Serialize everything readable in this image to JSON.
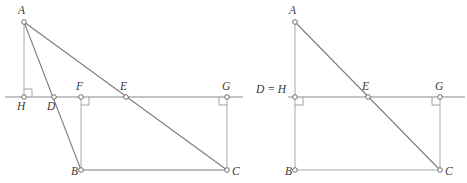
{
  "figure": {
    "title": "",
    "width": 467,
    "height": 183,
    "background": "#ffffff",
    "stroke_color": "#7d7d7d",
    "axis_color": "#8a8a8a",
    "vertex_fill": "#ffffff",
    "vertex_stroke": "#5d5d5d",
    "label_color": "#3a3a3a"
  },
  "panels": [
    {
      "id": "left",
      "name": "left-diagram",
      "points": {
        "A": {
          "label": "A",
          "x": 24,
          "y": 22,
          "lx": 18,
          "ly": 14
        },
        "B": {
          "label": "B",
          "x": 81,
          "y": 170,
          "lx": 71,
          "ly": 175
        },
        "C": {
          "label": "C",
          "x": 227,
          "y": 170,
          "lx": 232,
          "ly": 175
        },
        "D": {
          "label": "D",
          "x": 54,
          "y": 97,
          "lx": 47,
          "ly": 110
        },
        "E": {
          "label": "E",
          "x": 126,
          "y": 97,
          "lx": 120,
          "ly": 90
        },
        "F": {
          "label": "F",
          "x": 81,
          "y": 97,
          "lx": 76,
          "ly": 90
        },
        "G": {
          "label": "G",
          "x": 227,
          "y": 97,
          "lx": 222,
          "ly": 90
        },
        "H": {
          "label": "H",
          "x": 24,
          "y": 97,
          "lx": 17,
          "ly": 110
        }
      },
      "line": {
        "x1": 5,
        "y1": 97,
        "x2": 243,
        "y2": 97
      },
      "segments": [
        {
          "name": "segment-A-H",
          "from": "A",
          "to": "H",
          "style": "thin"
        },
        {
          "name": "segment-A-B",
          "from": "A",
          "to": "B",
          "style": "solid"
        },
        {
          "name": "segment-A-C",
          "from": "A",
          "to": "C",
          "style": "solid"
        },
        {
          "name": "segment-B-C",
          "from": "B",
          "to": "C",
          "style": "solid"
        },
        {
          "name": "segment-F-B",
          "from": "F",
          "to": "B",
          "style": "thin"
        },
        {
          "name": "segment-G-C",
          "from": "G",
          "to": "C",
          "style": "thin"
        }
      ],
      "right_angles": [
        {
          "name": "right-angle-at-H",
          "x": 24,
          "y": 97,
          "dx": 1,
          "dy": -1,
          "size": 8
        },
        {
          "name": "right-angle-at-F",
          "x": 81,
          "y": 97,
          "dx": 1,
          "dy": 1,
          "size": 8
        },
        {
          "name": "right-angle-at-G",
          "x": 227,
          "y": 97,
          "dx": -1,
          "dy": 1,
          "size": 8
        }
      ]
    },
    {
      "id": "right",
      "name": "right-diagram",
      "points": {
        "A": {
          "label": "A",
          "x": 295,
          "y": 22,
          "lx": 289,
          "ly": 14
        },
        "B": {
          "label": "B",
          "x": 295,
          "y": 170,
          "lx": 285,
          "ly": 175
        },
        "C": {
          "label": "C",
          "x": 440,
          "y": 170,
          "lx": 445,
          "ly": 175
        },
        "DH": {
          "label": "D = H",
          "x": 295,
          "y": 97,
          "lx": 256,
          "ly": 93
        },
        "E": {
          "label": "E",
          "x": 368,
          "y": 97,
          "lx": 362,
          "ly": 90
        },
        "G": {
          "label": "G",
          "x": 440,
          "y": 97,
          "lx": 435,
          "ly": 90
        }
      },
      "line": {
        "x1": 288,
        "y1": 97,
        "x2": 465,
        "y2": 97
      },
      "segments": [
        {
          "name": "segment-A-B",
          "from": "A",
          "to": "B",
          "style": "thin"
        },
        {
          "name": "segment-A-C",
          "from": "A",
          "to": "C",
          "style": "solid"
        },
        {
          "name": "segment-B-C",
          "from": "B",
          "to": "C",
          "style": "thin"
        },
        {
          "name": "segment-G-C",
          "from": "G",
          "to": "C",
          "style": "thin"
        }
      ],
      "right_angles": [
        {
          "name": "right-angle-at-DH",
          "x": 295,
          "y": 97,
          "dx": 1,
          "dy": 1,
          "size": 8
        },
        {
          "name": "right-angle-at-G",
          "x": 440,
          "y": 97,
          "dx": -1,
          "dy": 1,
          "size": 8
        }
      ]
    }
  ]
}
